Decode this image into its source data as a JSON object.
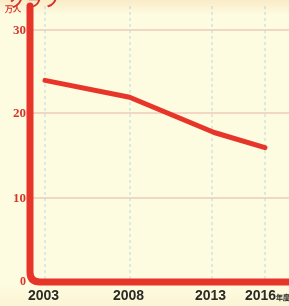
{
  "chart_data": {
    "type": "line",
    "title": "",
    "xlabel": "",
    "ylabel": "万人",
    "categories": [
      "2003",
      "2008",
      "2013",
      "2016"
    ],
    "x": [
      2003,
      2008,
      2013,
      2016
    ],
    "values": [
      24.0,
      22.0,
      17.8,
      16.0
    ],
    "series": [
      {
        "name": "人数",
        "values": [
          24.0,
          22.0,
          17.8,
          16.0
        ]
      }
    ],
    "xlim": [
      2003,
      2016
    ],
    "ylim": [
      0,
      30
    ],
    "yticks": [
      0,
      10,
      20,
      30
    ],
    "ytick_labels": [
      "0",
      "10",
      "20",
      "30"
    ],
    "xtick_labels": [
      "2003",
      "2008",
      "2013",
      "2016"
    ],
    "xtick_suffix": "年度",
    "grid": true,
    "grid_horizontal": true,
    "grid_vertical_dashed": true,
    "legend": "none",
    "legend_position": "none",
    "line_color": "#e8352a",
    "axis_color": "#e8352a",
    "background_color": "#fdfbe0",
    "hgrid_color": "#e8b3a6",
    "vgrid_color": "#bcd8e0",
    "ytick_color": "#d4382c",
    "xtick_color": "#2b2b28"
  },
  "axis": {
    "unit_label": "万人",
    "y_ticks": [
      {
        "label": "30",
        "value": 30
      },
      {
        "label": "20",
        "value": 20
      },
      {
        "label": "10",
        "value": 10
      },
      {
        "label": "0",
        "value": 0
      }
    ],
    "x_ticks": [
      {
        "label": "2003",
        "suffix": ""
      },
      {
        "label": "2008",
        "suffix": ""
      },
      {
        "label": "2013",
        "suffix": ""
      },
      {
        "label": "2016",
        "suffix": "年度"
      }
    ]
  },
  "title": {
    "cropped_heading": "グラフ"
  }
}
